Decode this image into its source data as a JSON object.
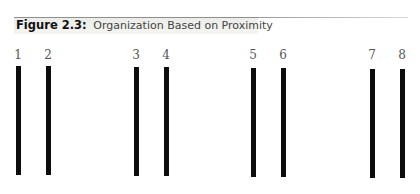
{
  "figure": {
    "number_label": "Figure 2.3:",
    "title": "Organization Based on Proximity"
  },
  "diagram": {
    "type": "vertical-lines-grouped-by-proximity",
    "lines": [
      {
        "label": "1",
        "x": 16,
        "top": 66,
        "bottom": 175
      },
      {
        "label": "2",
        "x": 46,
        "top": 66,
        "bottom": 175
      },
      {
        "label": "3",
        "x": 134,
        "top": 67,
        "bottom": 176
      },
      {
        "label": "4",
        "x": 164,
        "top": 67,
        "bottom": 176
      },
      {
        "label": "5",
        "x": 251,
        "top": 68,
        "bottom": 177
      },
      {
        "label": "6",
        "x": 281,
        "top": 68,
        "bottom": 177
      },
      {
        "label": "7",
        "x": 370,
        "top": 69,
        "bottom": 178
      },
      {
        "label": "8",
        "x": 400,
        "top": 69,
        "bottom": 178
      }
    ],
    "groups": [
      [
        "1",
        "2"
      ],
      [
        "3",
        "4"
      ],
      [
        "5",
        "6"
      ],
      [
        "7",
        "8"
      ]
    ],
    "line_color": "#0d0d0d"
  }
}
